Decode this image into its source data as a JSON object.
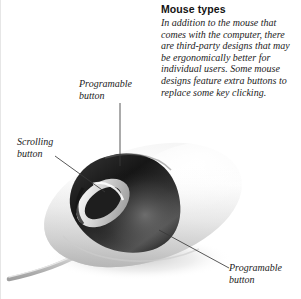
{
  "caption": {
    "title": "Mouse types",
    "body": "In addition to the mouse that comes with the computer, there are third-party designs that may be ergonomically better for individual users. Some mouse designs feature extra buttons to replace some key clicking."
  },
  "callouts": {
    "top": "Programable\nbutton",
    "left": "Scrolling\nbutton",
    "bottom": "Programable\nbutton"
  },
  "illustration": {
    "subject": "computer-mouse",
    "parts": {
      "body": "mouse-body",
      "button_cluster": "programable-button",
      "scroll_wheel": "scrolling-button",
      "cable": "mouse-cable",
      "shadow": "mouse-shadow"
    }
  },
  "colors": {
    "background": "#ffffff",
    "text": "#1c1c1c",
    "title": "#131313",
    "leader_line": "#3a3a3a",
    "body_light": "#ffffff",
    "body_mid": "#e2e2e2",
    "body_shade": "#bdbdbd",
    "button_dark": "#1a1a1a",
    "button_mid": "#4b4b4b",
    "wheel_ring": "#d8d8d8",
    "wheel_core": "#1e1e1e",
    "cable": "#c9c9c9",
    "shadow": "#d5d5d5"
  }
}
